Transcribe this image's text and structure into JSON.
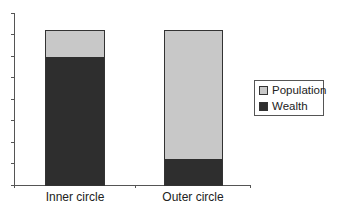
{
  "chart_data": {
    "type": "bar",
    "stacked": true,
    "title": "",
    "xlabel": "",
    "ylabel": "",
    "categories": [
      "Inner circle",
      "Outer circle"
    ],
    "series": [
      {
        "name": "Wealth",
        "color": "#2e2e2e",
        "values": [
          83,
          17
        ]
      },
      {
        "name": "Population",
        "color": "#c8c8c8",
        "values": [
          17,
          83
        ]
      }
    ],
    "y_tick_labels": [],
    "y_tick_count": 9,
    "grid": false,
    "legend_position": "right",
    "legend": [
      "Population",
      "Wealth"
    ],
    "note": "Values are relative shares (%) of each stacked bar; the y-axis has no numeric labels"
  },
  "legend": {
    "items": [
      {
        "label": "Population",
        "color": "#c8c8c8"
      },
      {
        "label": "Wealth",
        "color": "#2e2e2e"
      }
    ]
  },
  "axis": {
    "categories": [
      "Inner circle",
      "Outer circle"
    ]
  }
}
